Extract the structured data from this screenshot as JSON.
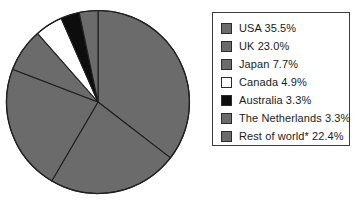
{
  "chart_data": {
    "type": "pie",
    "title": "",
    "subtitle": "",
    "xlabel": "",
    "ylabel": "",
    "legend_position": "right",
    "grid": false,
    "start_angle_deg": 0,
    "direction": "clockwise",
    "units": "percent",
    "categories": [
      "USA",
      "UK",
      "Japan",
      "Canada",
      "Australia",
      "The Netherlands",
      "Rest of world*"
    ],
    "values": [
      35.5,
      23.0,
      7.7,
      4.9,
      3.3,
      3.3,
      22.4
    ],
    "slice_order_clockwise": [
      "USA",
      "UK",
      "Rest of world*",
      "Japan",
      "Canada",
      "Australia",
      "The Netherlands"
    ],
    "slices": [
      {
        "label": "USA",
        "value": 35.5,
        "value_text": "35.5%",
        "fill": "#6b6b6b",
        "stroke": "#1f1f1f"
      },
      {
        "label": "UK",
        "value": 23.0,
        "value_text": "23.0%",
        "fill": "#6b6b6b",
        "stroke": "#1f1f1f"
      },
      {
        "label": "Rest of world*",
        "value": 22.4,
        "value_text": "22.4%",
        "fill": "#6b6b6b",
        "stroke": "#1f1f1f"
      },
      {
        "label": "Japan",
        "value": 7.7,
        "value_text": "7.7%",
        "fill": "#6b6b6b",
        "stroke": "#1f1f1f"
      },
      {
        "label": "Canada",
        "value": 4.9,
        "value_text": "4.9%",
        "fill": "#ffffff",
        "stroke": "#1f1f1f"
      },
      {
        "label": "Australia",
        "value": 3.3,
        "value_text": "3.3%",
        "fill": "#0d0d0d",
        "stroke": "#1f1f1f"
      },
      {
        "label": "The Netherlands",
        "value": 3.3,
        "value_text": "3.3%",
        "fill": "#6b6b6b",
        "stroke": "#1f1f1f"
      }
    ]
  },
  "legend": {
    "items": [
      {
        "text": "USA 35.5%",
        "swatch": "#6b6b6b"
      },
      {
        "text": "UK 23.0%",
        "swatch": "#6b6b6b"
      },
      {
        "text": "Japan 7.7%",
        "swatch": "#6b6b6b"
      },
      {
        "text": "Canada 4.9%",
        "swatch": "#ffffff"
      },
      {
        "text": "Australia 3.3%",
        "swatch": "#0d0d0d"
      },
      {
        "text": "The Netherlands 3.3%",
        "swatch": "#6b6b6b"
      },
      {
        "text": "Rest of world* 22.4%",
        "swatch": "#6b6b6b"
      }
    ]
  }
}
